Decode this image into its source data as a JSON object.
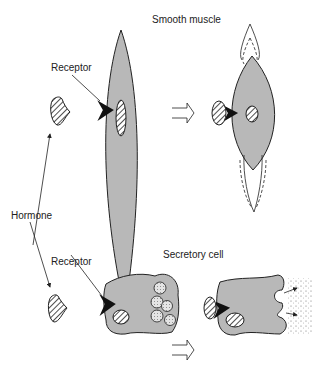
{
  "labels": {
    "smooth_muscle": "Smooth muscle",
    "receptor_top": "Receptor",
    "hormone": "Hormone",
    "secretory_cell": "Secretory cell",
    "receptor_bottom": "Receptor"
  },
  "colors": {
    "cell_fill": "#b8b8b8",
    "outline": "#222222",
    "receptor": "#111111",
    "vesicle_fill": "#d8d8d8"
  }
}
